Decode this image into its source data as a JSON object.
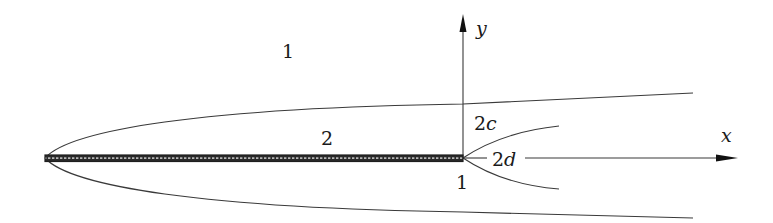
{
  "diagram": {
    "type": "flow-around-plate",
    "axes": {
      "x_label": "x",
      "y_label": "y"
    },
    "regions": {
      "outer": "1",
      "boundary_layer": "2",
      "wake_lower": "1"
    },
    "dimensions": {
      "inner_width": "2c",
      "wake_width": "2d"
    },
    "colors": {
      "line": "#3a3a3a",
      "plate": "#2a2a2a",
      "text": "#1a1a1a",
      "background": "#ffffff"
    }
  },
  "labels": {
    "region_1_top": "1",
    "region_2": "2",
    "dim_2c_num": "2",
    "dim_2c_var": "c",
    "dim_2d_num": "2",
    "dim_2d_var": "d",
    "region_1_bottom": "1",
    "axis_y": "y",
    "axis_x": "x"
  }
}
